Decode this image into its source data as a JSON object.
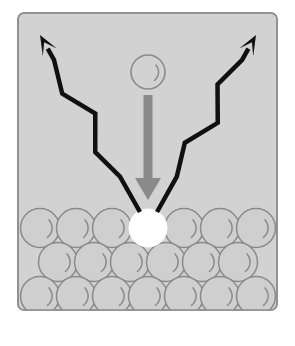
{
  "figure": {
    "width": 295,
    "height": 346,
    "background_color": "#ffffff"
  },
  "panel": {
    "name": "diagram-panel",
    "x": 18,
    "y": 13,
    "width": 259,
    "height": 297,
    "fill_color": "#d2d2d2",
    "border_color": "#8f8f8f",
    "corner_radius": 6
  },
  "incident_particle": {
    "label": "incident-particle",
    "center_x": 148,
    "center_y": 72,
    "radius": 17,
    "fill_color": "#d2d2d2",
    "stroke_color": "#8a8a8a",
    "highlight": "crescent-arc"
  },
  "incident_arrow": {
    "label": "incident-arrow",
    "shaft_x": 148,
    "shaft_top": 95,
    "shaft_bottom": 178,
    "shaft_width": 9,
    "head_width": 26,
    "head_height": 22,
    "head_tip_y": 200,
    "color": "#8a8a8a",
    "direction": "down"
  },
  "impact_site": {
    "label": "impact-site",
    "center_x": 148,
    "center_y": 228,
    "radius": 19,
    "fill_color": "#ffffff",
    "stroke_color": "#ffffff"
  },
  "emission_arrows": [
    {
      "label": "emission-arrow-left",
      "side": "left",
      "origin_x": 140,
      "origin_y": 212,
      "tip_x": 40,
      "tip_y": 35,
      "color": "#101010",
      "style": "zigzag",
      "zigzag_segments": 4,
      "stroke_width": 4.5
    },
    {
      "label": "emission-arrow-right",
      "side": "right",
      "origin_x": 157,
      "origin_y": 212,
      "tip_x": 256,
      "tip_y": 35,
      "color": "#101010",
      "style": "zigzag",
      "zigzag_segments": 4,
      "stroke_width": 4.5
    }
  ],
  "lattice": {
    "label": "close-packed-lattice",
    "sphere_radius": 19.5,
    "sphere_fill": "#cfcfcf",
    "sphere_stroke": "#8a8a8a",
    "highlight_color": "#8a8a8a",
    "rows": [
      {
        "row_index": 0,
        "center_y": 228,
        "count": 7,
        "start_x": 40,
        "spacing": 36,
        "white_index": 3
      },
      {
        "row_index": 1,
        "center_y": 262,
        "count": 6,
        "start_x": 58,
        "spacing": 36,
        "white_index": -1
      },
      {
        "row_index": 2,
        "center_y": 296,
        "count": 7,
        "start_x": 40,
        "spacing": 36,
        "white_index": -1
      }
    ]
  },
  "colors": {
    "panel_fill": "#d2d2d2",
    "panel_border": "#8f8f8f",
    "sphere_fill": "#cfcfcf",
    "sphere_outline": "#8a8a8a",
    "arrow_gray": "#8a8a8a",
    "arrow_black": "#101010",
    "impact_white": "#ffffff"
  }
}
